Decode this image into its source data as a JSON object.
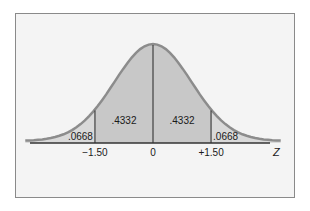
{
  "chart_data": {
    "type": "area",
    "title": "",
    "xlabel": "Z",
    "ylabel": "",
    "distribution": "standard normal",
    "xlim": [
      -3.3,
      3.3
    ],
    "x_ticks": [
      -1.5,
      0,
      1.5
    ],
    "tick_labels": [
      "−1.50",
      "0",
      "+1.50"
    ],
    "regions": [
      {
        "name": "left-tail",
        "from": -3.3,
        "to": -1.5,
        "area": 0.0668,
        "label": ".0668",
        "shade": "light"
      },
      {
        "name": "left-center",
        "from": -1.5,
        "to": 0,
        "area": 0.4332,
        "label": ".4332",
        "shade": "dark"
      },
      {
        "name": "right-center",
        "from": 0,
        "to": 1.5,
        "area": 0.4332,
        "label": ".4332",
        "shade": "dark"
      },
      {
        "name": "right-tail",
        "from": 1.5,
        "to": 3.3,
        "area": 0.0668,
        "label": ".0668",
        "shade": "light"
      }
    ],
    "colors": {
      "curve": "#8c8c8c",
      "dark_fill": "#c8c8c8",
      "light_fill": "#d9d9d9",
      "axis": "#333333",
      "background": "#f4f4f4"
    }
  }
}
